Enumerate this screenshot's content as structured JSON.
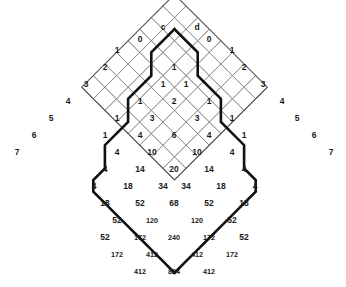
{
  "figure": {
    "kind": "rotated-square-lattice-number-array",
    "background_color": "#ffffff",
    "grid_line_color": "#8a8a8a",
    "outline_color": "#555555",
    "path_color": "#111111",
    "text_color": "#1a1a1a"
  },
  "geometry": {
    "cell_half_diagonal": 11.6,
    "apex_x": 174.5,
    "apex_y": 6.0,
    "rows": 13
  },
  "labels": {
    "top_left": "c",
    "top_right": "d"
  },
  "left_edge_labels": [
    "0",
    "1",
    "2",
    "3",
    "4",
    "5",
    "6",
    "7"
  ],
  "right_edge_labels": [
    "0",
    "1",
    "2",
    "3",
    "4",
    "5",
    "6",
    "7"
  ],
  "chart_data": {
    "type": "table",
    "title": "",
    "xlabel": "",
    "ylabel": "",
    "grid": true,
    "legend": "none",
    "note": "Values are placed on a 45-degree rotated lattice. Each row lists the cell values from left to right for that diagonal row of the diamond.",
    "rows": [
      {
        "row": 0,
        "values": [
          "c",
          "d"
        ]
      },
      {
        "row": 1,
        "values": [
          "0",
          "0"
        ]
      },
      {
        "row": 2,
        "values": [
          "1",
          "1",
          "1"
        ]
      },
      {
        "row": 3,
        "values": [
          "2",
          "1",
          "1",
          "2"
        ]
      },
      {
        "row": 4,
        "values": [
          "3",
          "1",
          "2",
          "1",
          "3"
        ]
      },
      {
        "row": 5,
        "values": [
          "4",
          "1",
          "3",
          "3",
          "1",
          "4"
        ]
      },
      {
        "row": 6,
        "values": [
          "5",
          "1",
          "4",
          "6",
          "4",
          "1",
          "5"
        ]
      },
      {
        "row": 7,
        "values": [
          "6",
          "1",
          "4",
          "10",
          "10",
          "4",
          "1",
          "6"
        ]
      },
      {
        "row": 8,
        "values": [
          "7",
          "4",
          "14",
          "20",
          "14",
          "4",
          "7"
        ]
      },
      {
        "row": 9,
        "values": [
          "4",
          "18",
          "34",
          "34",
          "18",
          "4"
        ]
      },
      {
        "row": 10,
        "values": [
          "18",
          "52",
          "68",
          "52",
          "18"
        ]
      },
      {
        "row": 11,
        "values": [
          "52",
          "120",
          "120",
          "52"
        ]
      },
      {
        "row": 12,
        "values": [
          "52",
          "172",
          "240",
          "172",
          "52"
        ]
      },
      {
        "row": 13,
        "values": [
          "172",
          "412",
          "412",
          "172"
        ]
      },
      {
        "row": 14,
        "values": [
          "412",
          "824",
          "412"
        ]
      }
    ],
    "cells": [
      {
        "id": "c-label",
        "text": "c",
        "cx": 163,
        "cy": 28,
        "bold": true
      },
      {
        "id": "d-label",
        "text": "d",
        "cx": 197,
        "cy": 28,
        "bold": true
      },
      {
        "id": "l0",
        "text": "0",
        "cx": 140,
        "cy": 40
      },
      {
        "id": "r0",
        "text": "0",
        "cx": 209,
        "cy": 40
      },
      {
        "id": "l1",
        "text": "1",
        "cx": 117,
        "cy": 51
      },
      {
        "id": "c1",
        "text": "1",
        "cx": 174,
        "cy": 68
      },
      {
        "id": "r1",
        "text": "1",
        "cx": 232,
        "cy": 51
      },
      {
        "id": "l2",
        "text": "2",
        "cx": 105,
        "cy": 68
      },
      {
        "id": "c2a",
        "text": "1",
        "cx": 163,
        "cy": 85
      },
      {
        "id": "c2b",
        "text": "1",
        "cx": 186,
        "cy": 85
      },
      {
        "id": "r2",
        "text": "2",
        "cx": 244,
        "cy": 68
      },
      {
        "id": "l3",
        "text": "3",
        "cx": 86,
        "cy": 85
      },
      {
        "id": "c3a",
        "text": "1",
        "cx": 140,
        "cy": 102
      },
      {
        "id": "c3b",
        "text": "2",
        "cx": 174,
        "cy": 102
      },
      {
        "id": "c3c",
        "text": "1",
        "cx": 209,
        "cy": 102
      },
      {
        "id": "r3",
        "text": "3",
        "cx": 263,
        "cy": 85
      },
      {
        "id": "l4",
        "text": "4",
        "cx": 68,
        "cy": 102
      },
      {
        "id": "c4a",
        "text": "1",
        "cx": 117,
        "cy": 119
      },
      {
        "id": "c4b",
        "text": "3",
        "cx": 152,
        "cy": 119
      },
      {
        "id": "c4c",
        "text": "3",
        "cx": 197,
        "cy": 119
      },
      {
        "id": "c4d",
        "text": "1",
        "cx": 232,
        "cy": 119
      },
      {
        "id": "r4",
        "text": "4",
        "cx": 282,
        "cy": 102
      },
      {
        "id": "l5",
        "text": "5",
        "cx": 51,
        "cy": 119
      },
      {
        "id": "c5a",
        "text": "1",
        "cx": 105,
        "cy": 136
      },
      {
        "id": "c5b",
        "text": "4",
        "cx": 140,
        "cy": 136
      },
      {
        "id": "c5c",
        "text": "6",
        "cx": 174,
        "cy": 136
      },
      {
        "id": "c5d",
        "text": "4",
        "cx": 209,
        "cy": 136
      },
      {
        "id": "c5e",
        "text": "1",
        "cx": 244,
        "cy": 136
      },
      {
        "id": "r5",
        "text": "5",
        "cx": 297,
        "cy": 119
      },
      {
        "id": "l6",
        "text": "6",
        "cx": 34,
        "cy": 136
      },
      {
        "id": "c6a",
        "text": "4",
        "cx": 117,
        "cy": 153
      },
      {
        "id": "c6b",
        "text": "10",
        "cx": 152,
        "cy": 153
      },
      {
        "id": "c6c",
        "text": "10",
        "cx": 197,
        "cy": 153
      },
      {
        "id": "c6d",
        "text": "4",
        "cx": 232,
        "cy": 153
      },
      {
        "id": "r6",
        "text": "6",
        "cx": 314,
        "cy": 136
      },
      {
        "id": "l7",
        "text": "7",
        "cx": 17,
        "cy": 153
      },
      {
        "id": "c7a",
        "text": "4",
        "cx": 105,
        "cy": 170
      },
      {
        "id": "c7b",
        "text": "14",
        "cx": 140,
        "cy": 170
      },
      {
        "id": "c7c",
        "text": "20",
        "cx": 174,
        "cy": 170
      },
      {
        "id": "c7d",
        "text": "14",
        "cx": 209,
        "cy": 170
      },
      {
        "id": "c7e",
        "text": "4",
        "cx": 244,
        "cy": 170
      },
      {
        "id": "r7",
        "text": "7",
        "cx": 331,
        "cy": 153
      },
      {
        "id": "c8a",
        "text": "4",
        "cx": 94,
        "cy": 187
      },
      {
        "id": "c8b",
        "text": "18",
        "cx": 128,
        "cy": 187
      },
      {
        "id": "c8c",
        "text": "34",
        "cx": 163,
        "cy": 187
      },
      {
        "id": "c8d",
        "text": "34",
        "cx": 186,
        "cy": 187
      },
      {
        "id": "c8e",
        "text": "18",
        "cx": 221,
        "cy": 187
      },
      {
        "id": "c8f",
        "text": "4",
        "cx": 255,
        "cy": 187
      },
      {
        "id": "c9a",
        "text": "18",
        "cx": 105,
        "cy": 204
      },
      {
        "id": "c9b",
        "text": "52",
        "cx": 140,
        "cy": 204
      },
      {
        "id": "c9c",
        "text": "68",
        "cx": 174,
        "cy": 204
      },
      {
        "id": "c9d",
        "text": "52",
        "cx": 209,
        "cy": 204
      },
      {
        "id": "c9e",
        "text": "18",
        "cx": 244,
        "cy": 204
      },
      {
        "id": "c10a",
        "text": "52",
        "cx": 117,
        "cy": 221
      },
      {
        "id": "c10b",
        "text": "120",
        "cx": 152,
        "cy": 221
      },
      {
        "id": "c10c",
        "text": "120",
        "cx": 197,
        "cy": 221
      },
      {
        "id": "c10d",
        "text": "52",
        "cx": 232,
        "cy": 221
      },
      {
        "id": "c11a",
        "text": "52",
        "cx": 105,
        "cy": 238
      },
      {
        "id": "c11b",
        "text": "172",
        "cx": 140,
        "cy": 238
      },
      {
        "id": "c11c",
        "text": "240",
        "cx": 174,
        "cy": 238
      },
      {
        "id": "c11d",
        "text": "172",
        "cx": 209,
        "cy": 238
      },
      {
        "id": "c11e",
        "text": "52",
        "cx": 244,
        "cy": 238
      },
      {
        "id": "c12a",
        "text": "172",
        "cx": 117,
        "cy": 255
      },
      {
        "id": "c12b",
        "text": "412",
        "cx": 152,
        "cy": 255
      },
      {
        "id": "c12c",
        "text": "412",
        "cx": 197,
        "cy": 255
      },
      {
        "id": "c12d",
        "text": "172",
        "cx": 232,
        "cy": 255
      },
      {
        "id": "c13a",
        "text": "412",
        "cx": 140,
        "cy": 272
      },
      {
        "id": "c13b",
        "text": "824",
        "cx": 174,
        "cy": 272
      },
      {
        "id": "c13c",
        "text": "412",
        "cx": 209,
        "cy": 272
      }
    ]
  }
}
